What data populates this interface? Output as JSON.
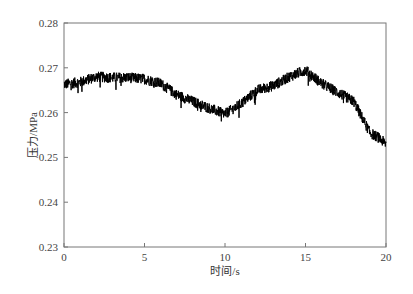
{
  "chart_data": {
    "type": "line",
    "title": "",
    "xlabel": "时间/s",
    "ylabel": "压力/MPa",
    "xlim": [
      0,
      20
    ],
    "ylim": [
      0.23,
      0.28
    ],
    "xticks": [
      0,
      5,
      10,
      15,
      20
    ],
    "xtick_labels": [
      "0",
      "5",
      "10",
      "15",
      "20"
    ],
    "yticks": [
      0.23,
      0.24,
      0.25,
      0.26,
      0.27,
      0.28
    ],
    "ytick_labels": [
      "0.23",
      "0.24",
      "0.25",
      "0.26",
      "0.27",
      "0.28"
    ],
    "grid": false,
    "legend": null,
    "series": [
      {
        "name": "pressure",
        "color": "#000000",
        "noisy": true,
        "noise_amplitude": 0.0012,
        "x": [
          0,
          1,
          2,
          3,
          4,
          5,
          6,
          7,
          8,
          9,
          10,
          11,
          12,
          13,
          14,
          15,
          16,
          17,
          18,
          18.5,
          19,
          19.5,
          20
        ],
        "y": [
          0.2663,
          0.2668,
          0.268,
          0.2678,
          0.2678,
          0.2675,
          0.2665,
          0.264,
          0.2625,
          0.261,
          0.2597,
          0.262,
          0.265,
          0.266,
          0.268,
          0.2695,
          0.2665,
          0.2645,
          0.2625,
          0.259,
          0.2555,
          0.2545,
          0.253
        ]
      }
    ]
  }
}
